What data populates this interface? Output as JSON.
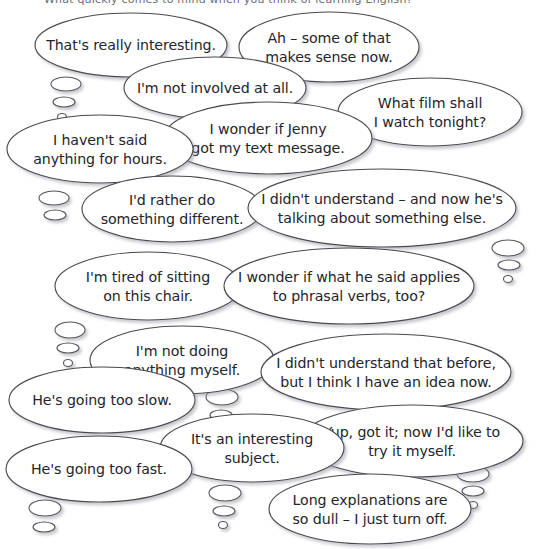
{
  "page": {
    "background_color": "#ffffff",
    "bubble_fill": "#ffffff",
    "bubble_stroke": "#4a4a52",
    "text_color": "#24242a",
    "shadow_color": "#b9b9c0",
    "width": 547,
    "height": 549,
    "top_cut_text": "What quickly comes to mind when you think of learning English?"
  },
  "bubbles": [
    {
      "id": "thats-really-interesting",
      "lines": [
        "That's really interesting."
      ],
      "cx": 131,
      "cy": 45,
      "rx": 96,
      "ry": 32,
      "size": "normal",
      "tail": {
        "dots": [
          {
            "cx": 66,
            "cy": 84,
            "rx": 15,
            "ry": 7
          },
          {
            "cx": 64,
            "cy": 102,
            "rx": 11,
            "ry": 5
          },
          {
            "cx": 62,
            "cy": 117,
            "rx": 4.5,
            "ry": 3.5
          }
        ]
      }
    },
    {
      "id": "ah-some-of-that",
      "lines": [
        "Ah – some of that",
        "makes sense now."
      ],
      "cx": 329,
      "cy": 47,
      "rx": 90,
      "ry": 35,
      "size": "normal",
      "tail": {
        "dots": []
      }
    },
    {
      "id": "im-not-involved-at-all",
      "lines": [
        "I'm not involved at all."
      ],
      "cx": 215,
      "cy": 88,
      "rx": 91,
      "ry": 31,
      "size": "normal",
      "tail": {
        "dots": []
      }
    },
    {
      "id": "what-film-shall-i-watch",
      "lines": [
        "What film shall",
        "I watch tonight?"
      ],
      "cx": 430,
      "cy": 112,
      "rx": 92,
      "ry": 34,
      "size": "normal",
      "tail": {
        "dots": []
      }
    },
    {
      "id": "i-wonder-if-jenny",
      "lines": [
        "I wonder if Jenny",
        "got my text message."
      ],
      "cx": 268,
      "cy": 138,
      "rx": 104,
      "ry": 36,
      "size": "normal",
      "tail": {
        "dots": []
      }
    },
    {
      "id": "i-havent-said-anything",
      "lines": [
        "I haven't said",
        "anything for hours."
      ],
      "cx": 100,
      "cy": 149,
      "rx": 93,
      "ry": 34,
      "size": "normal",
      "tail": {
        "dots": [
          {
            "cx": 54,
            "cy": 198,
            "rx": 15,
            "ry": 7
          },
          {
            "cx": 55,
            "cy": 215,
            "rx": 11,
            "ry": 5
          }
        ]
      }
    },
    {
      "id": "id-rather-do-something-different",
      "lines": [
        "I'd rather do",
        "something different."
      ],
      "cx": 172,
      "cy": 209,
      "rx": 90,
      "ry": 33,
      "size": "normal",
      "tail": {
        "dots": []
      }
    },
    {
      "id": "i-didnt-understand-and-now-hes",
      "lines": [
        "I didn't understand – and now he's",
        "talking about something else."
      ],
      "cx": 382,
      "cy": 208,
      "rx": 134,
      "ry": 39,
      "size": "normal",
      "tail": {
        "dots": [
          {
            "cx": 508,
            "cy": 248,
            "rx": 16,
            "ry": 8
          },
          {
            "cx": 509,
            "cy": 265,
            "rx": 11,
            "ry": 5
          },
          {
            "cx": 508,
            "cy": 279,
            "rx": 4.5,
            "ry": 3.5
          }
        ]
      }
    },
    {
      "id": "im-tired-of-sitting",
      "lines": [
        "I'm tired of sitting",
        "on this chair."
      ],
      "cx": 148,
      "cy": 286,
      "rx": 93,
      "ry": 34,
      "size": "normal",
      "tail": {
        "dots": [
          {
            "cx": 70,
            "cy": 330,
            "rx": 15,
            "ry": 8
          },
          {
            "cx": 68,
            "cy": 348,
            "rx": 11,
            "ry": 5
          },
          {
            "cx": 68,
            "cy": 363,
            "rx": 4.5,
            "ry": 3.5
          }
        ]
      }
    },
    {
      "id": "i-wonder-if-what-he-said",
      "lines": [
        "I wonder if what he said applies",
        "to phrasal verbs, too?"
      ],
      "cx": 349,
      "cy": 286,
      "rx": 125,
      "ry": 38,
      "size": "normal",
      "tail": {
        "dots": []
      }
    },
    {
      "id": "im-not-doing-anything-myself",
      "lines": [
        "I'm not doing",
        "anything myself."
      ],
      "cx": 182,
      "cy": 360,
      "rx": 92,
      "ry": 34,
      "size": "normal",
      "tail": {
        "dots": [
          {
            "cx": 222,
            "cy": 397,
            "rx": 16,
            "ry": 8
          },
          {
            "cx": 221,
            "cy": 415,
            "rx": 11,
            "ry": 5
          },
          {
            "cx": 221,
            "cy": 429,
            "rx": 4.5,
            "ry": 3.5
          }
        ]
      }
    },
    {
      "id": "i-didnt-understand-that-before",
      "lines": [
        "I didn't understand that before,",
        "but I think I have an idea now."
      ],
      "cx": 386,
      "cy": 372,
      "rx": 125,
      "ry": 38,
      "size": "normal",
      "tail": {
        "dots": []
      }
    },
    {
      "id": "hes-going-too-slow",
      "lines": [
        "He's going too slow."
      ],
      "cx": 102,
      "cy": 400,
      "rx": 93,
      "ry": 33,
      "size": "normal",
      "tail": {
        "dots": []
      }
    },
    {
      "id": "yup-got-it-now-id-like-to",
      "lines": [
        "Yup, got it; now I'd like to",
        "try it myself."
      ],
      "cx": 412,
      "cy": 441,
      "rx": 111,
      "ry": 36,
      "size": "normal",
      "tail": {
        "dots": [
          {
            "cx": 473,
            "cy": 474,
            "rx": 16,
            "ry": 8
          },
          {
            "cx": 473,
            "cy": 491,
            "rx": 11,
            "ry": 5
          },
          {
            "cx": 473,
            "cy": 505,
            "rx": 4.5,
            "ry": 3.5
          }
        ]
      }
    },
    {
      "id": "its-an-interesting-subject",
      "lines": [
        "It's an interesting",
        "subject."
      ],
      "cx": 252,
      "cy": 448,
      "rx": 92,
      "ry": 34,
      "size": "normal",
      "tail": {
        "dots": [
          {
            "cx": 225,
            "cy": 493,
            "rx": 16,
            "ry": 8
          },
          {
            "cx": 224,
            "cy": 511,
            "rx": 11,
            "ry": 5
          },
          {
            "cx": 223,
            "cy": 525,
            "rx": 4.5,
            "ry": 3.5
          }
        ]
      }
    },
    {
      "id": "hes-going-too-fast",
      "lines": [
        "He's going too fast."
      ],
      "cx": 99,
      "cy": 469,
      "rx": 93,
      "ry": 33,
      "size": "normal",
      "tail": {
        "dots": [
          {
            "cx": 45,
            "cy": 508,
            "rx": 16,
            "ry": 8
          },
          {
            "cx": 44,
            "cy": 527,
            "rx": 11,
            "ry": 5
          }
        ]
      }
    },
    {
      "id": "long-explanations-are-so-dull",
      "lines": [
        "Long explanations are",
        "so dull – I just turn off."
      ],
      "cx": 370,
      "cy": 509,
      "rx": 101,
      "ry": 35,
      "size": "normal",
      "tail": {
        "dots": []
      }
    }
  ]
}
